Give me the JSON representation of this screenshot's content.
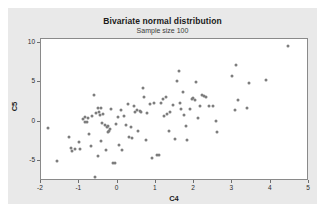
{
  "chart_data": {
    "type": "scatter",
    "title": "Bivariate normal distribution",
    "subtitle": "Sample size 100",
    "xlabel": "C4",
    "ylabel": "C5",
    "xlim": [
      -2,
      5
    ],
    "ylim": [
      -7.5,
      10.5
    ],
    "xticks": [
      -2,
      -1,
      0,
      1,
      2,
      3,
      4,
      5
    ],
    "xticklabels": [
      "-2",
      "-1",
      "0",
      "1",
      "2",
      "3",
      "4",
      "5"
    ],
    "yticks": [
      -5,
      0,
      5,
      10
    ],
    "yticklabels": [
      "-5",
      "0",
      "5",
      "10"
    ],
    "grid": false,
    "legend": null,
    "marker": {
      "shape": "circle",
      "color": "#7d7d7d",
      "size": 3
    },
    "n_points": 100,
    "points": [
      [
        -1.82,
        -0.75
      ],
      [
        -1.58,
        -4.95
      ],
      [
        -1.26,
        -1.95
      ],
      [
        -1.22,
        -3.3
      ],
      [
        -1.2,
        -3.7
      ],
      [
        -1.1,
        -3.45
      ],
      [
        -1.02,
        -2.6
      ],
      [
        -0.98,
        -3.4
      ],
      [
        -0.9,
        0.3
      ],
      [
        -0.86,
        0.0
      ],
      [
        -0.84,
        0.55
      ],
      [
        -0.8,
        -0.05
      ],
      [
        -0.78,
        0.45
      ],
      [
        -0.74,
        -1.6
      ],
      [
        -0.7,
        -3.05
      ],
      [
        -0.66,
        0.8
      ],
      [
        -0.62,
        3.45
      ],
      [
        -0.58,
        -7.05
      ],
      [
        -0.56,
        1.1
      ],
      [
        -0.52,
        1.75
      ],
      [
        -0.5,
        -4.35
      ],
      [
        -0.48,
        1.2
      ],
      [
        -0.46,
        0.9
      ],
      [
        -0.44,
        1.7
      ],
      [
        -0.42,
        -2.4
      ],
      [
        -0.4,
        -0.15
      ],
      [
        -0.38,
        1.05
      ],
      [
        -0.34,
        -0.35
      ],
      [
        -0.3,
        -3.55
      ],
      [
        -0.28,
        -0.6
      ],
      [
        -0.26,
        -1.35
      ],
      [
        -0.24,
        -0.5
      ],
      [
        -0.22,
        -1.2
      ],
      [
        -0.2,
        -0.95
      ],
      [
        -0.16,
        1.6
      ],
      [
        -0.12,
        -5.2
      ],
      [
        -0.08,
        -5.2
      ],
      [
        -0.04,
        -0.25
      ],
      [
        0.0,
        0.6
      ],
      [
        0.04,
        -2.95
      ],
      [
        0.08,
        1.55
      ],
      [
        0.12,
        -3.55
      ],
      [
        0.18,
        0.7
      ],
      [
        0.22,
        -0.45
      ],
      [
        0.26,
        2.25
      ],
      [
        0.3,
        -1.95
      ],
      [
        0.34,
        -0.6
      ],
      [
        0.38,
        -2.0
      ],
      [
        0.42,
        2.05
      ],
      [
        0.46,
        1.3
      ],
      [
        0.5,
        1.55
      ],
      [
        0.54,
        -1.1
      ],
      [
        0.58,
        1.4
      ],
      [
        0.62,
        1.2
      ],
      [
        0.66,
        4.3
      ],
      [
        0.7,
        3.1
      ],
      [
        0.74,
        -2.25
      ],
      [
        0.78,
        1.15
      ],
      [
        0.84,
        2.25
      ],
      [
        0.9,
        -4.6
      ],
      [
        0.96,
        2.35
      ],
      [
        1.02,
        -4.15
      ],
      [
        1.08,
        -4.2
      ],
      [
        1.14,
        2.4
      ],
      [
        1.18,
        2.85
      ],
      [
        1.22,
        0.8
      ],
      [
        1.26,
        3.2
      ],
      [
        1.3,
        1.05
      ],
      [
        1.34,
        -1.15
      ],
      [
        1.38,
        1.25
      ],
      [
        1.44,
        2.1
      ],
      [
        1.5,
        -2.2
      ],
      [
        1.56,
        5.2
      ],
      [
        1.6,
        6.45
      ],
      [
        1.64,
        2.45
      ],
      [
        1.66,
        1.6
      ],
      [
        1.7,
        3.75
      ],
      [
        1.74,
        0.85
      ],
      [
        1.78,
        -0.55
      ],
      [
        1.82,
        -2.25
      ],
      [
        1.88,
        1.65
      ],
      [
        1.94,
        2.95
      ],
      [
        1.98,
        3.05
      ],
      [
        2.02,
        2.75
      ],
      [
        2.06,
        5.05
      ],
      [
        2.1,
        0.5
      ],
      [
        2.14,
        1.95
      ],
      [
        2.2,
        3.35
      ],
      [
        2.26,
        3.3
      ],
      [
        2.32,
        3.15
      ],
      [
        2.4,
        1.95
      ],
      [
        2.48,
        2.05
      ],
      [
        2.56,
        0.1
      ],
      [
        2.6,
        -1.3
      ],
      [
        2.98,
        5.8
      ],
      [
        3.06,
        1.45
      ],
      [
        3.1,
        7.15
      ],
      [
        3.14,
        2.8
      ],
      [
        3.38,
        1.75
      ],
      [
        3.42,
        4.9
      ],
      [
        3.88,
        5.35
      ],
      [
        4.44,
        9.55
      ]
    ]
  }
}
